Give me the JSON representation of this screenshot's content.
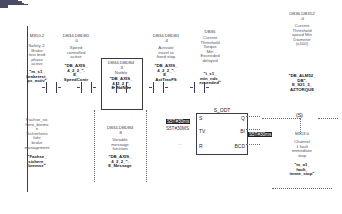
{
  "editor": {
    "language": "LAD",
    "network_title": "",
    "accent_selection": "#1f1f28",
    "wire_color": "#4a4a68"
  },
  "elements": {
    "contact1": {
      "address": "M810.2",
      "comment": "Safety 2:\nBrake\ntest feed\nphase\nactive",
      "symbol": "\"m_s1_\nbraketest_\nps_activ\"",
      "type": "NO-contact"
    },
    "contact1_below": {
      "comment": "Fachse_sic\nhere_brems\ne\nSicherheits\nfahr\nbrake\nmanagement",
      "symbol": "\"Fachse_\nsichere_\nbremse\""
    },
    "contact2": {
      "address": "DB34.DBDB1\n.0",
      "comment": "Speed\ncontrolled\nactive",
      "symbol": "\"DB_AXIS_\n4_2_2_\".\nE_\nSpeedContr",
      "type": "NO-contact"
    },
    "contact3_selected": {
      "address": "DB34.DBDB4\n.3",
      "comment": "Notblo",
      "symbol": "\"DB_AXIS_\n4_2_2_\".\nE_NdNds",
      "type": "NO-contact",
      "selected": true
    },
    "contact3_below": {
      "address": "DB34.DBDB4\n.8",
      "comment": "Variable\nmessage\nfunction",
      "symbol": "\"DB_AXIS_\n4_2_2_\".\nE_Message"
    },
    "contact4": {
      "address": "DB34.DBDB1\n.4",
      "comment": "Activate\ntravel to\nfixed stop",
      "symbol": "\"DB_AXIS_\n4_2_2_\".\nE_\nActTravFS",
      "type": "NO-contact"
    },
    "contact5": {
      "address": "DB36",
      "comment": "Current\nThreshold\nTorque\nMin\nExceeded\ndelayed",
      "symbol": "\"t_s1_\nmin_nds_\nexceeded\"",
      "type": "NO-contact"
    }
  },
  "timer": {
    "type": "S_ODT",
    "inputs": [
      "S",
      "TV",
      "R"
    ],
    "outputs": [
      "Q",
      "BI",
      "BCD"
    ],
    "tv_value_highlighted": "S5T#30ms",
    "tv_value_plain": "S5T#30MS",
    "bi_output": "...",
    "bcd_output": "..."
  },
  "output_branch": {
    "set_operand": {
      "address": "DB36.DBX52\n.0",
      "comment": "Current\nThreshold\nspeed Min\nDiameter\n(x100)",
      "symbol": "\"DB_ALM52_\nDB\".\nE_S21_3_\nAZTORQUE"
    },
    "set_coil": "(S)",
    "reset_operand": {
      "address": "M113.0",
      "comment": "Channel\n1 fault\nimmediate\nstop",
      "symbol": "\"m_o1_\nfault_\nimme_stop\""
    }
  },
  "bcd_tag": {
    "label": "S5T#30ms"
  }
}
